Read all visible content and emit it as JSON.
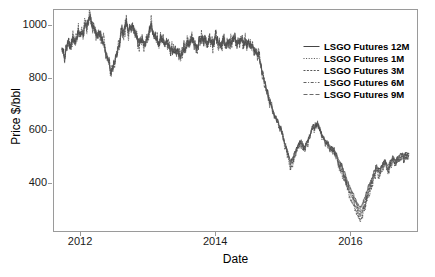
{
  "chart_data": {
    "type": "line",
    "title": "",
    "xlabel": "Date",
    "ylabel": "Price $/bbl",
    "xticks": [
      "2012",
      "2014",
      "2016"
    ],
    "xtick_values": [
      2012,
      2014,
      2016
    ],
    "yticks": [
      "1000",
      "800",
      "600",
      "400"
    ],
    "ytick_values": [
      1000,
      800,
      600,
      400
    ],
    "xlim": [
      2011.6,
      2017.0
    ],
    "ylim": [
      215,
      1060
    ],
    "grid": false,
    "legend_position": "upper right",
    "series": [
      {
        "name": "LSGO Futures 12M",
        "style": "solid",
        "color": "#303030",
        "dash": "none"
      },
      {
        "name": "LSGO Futures 1M",
        "style": "dotted",
        "color": "#3a3a3a",
        "dash": "1,1.6"
      },
      {
        "name": "LSGO Futures 3M",
        "style": "dashed-fine",
        "color": "#454545",
        "dash": "2,1.4"
      },
      {
        "name": "LSGO Futures 6M",
        "style": "dash-dot",
        "color": "#4f4f4f",
        "dash": "3,1.6,1,1.6"
      },
      {
        "name": "LSGO Futures 9M",
        "style": "long-dash",
        "color": "#5a5a5a",
        "dash": "4,2"
      }
    ],
    "x": [
      2011.72,
      2011.76,
      2011.8,
      2011.84,
      2011.88,
      2011.92,
      2011.96,
      2012.0,
      2012.04,
      2012.08,
      2012.12,
      2012.16,
      2012.2,
      2012.24,
      2012.28,
      2012.32,
      2012.36,
      2012.4,
      2012.44,
      2012.48,
      2012.52,
      2012.56,
      2012.6,
      2012.64,
      2012.68,
      2012.72,
      2012.76,
      2012.8,
      2012.84,
      2012.88,
      2012.92,
      2012.96,
      2013.0,
      2013.04,
      2013.08,
      2013.12,
      2013.16,
      2013.2,
      2013.24,
      2013.28,
      2013.32,
      2013.36,
      2013.4,
      2013.44,
      2013.48,
      2013.52,
      2013.56,
      2013.6,
      2013.64,
      2013.68,
      2013.72,
      2013.76,
      2013.8,
      2013.84,
      2013.88,
      2013.92,
      2013.96,
      2014.0,
      2014.04,
      2014.08,
      2014.12,
      2014.16,
      2014.2,
      2014.24,
      2014.28,
      2014.32,
      2014.36,
      2014.4,
      2014.44,
      2014.48,
      2014.52,
      2014.56,
      2014.6,
      2014.64,
      2014.68,
      2014.72,
      2014.76,
      2014.8,
      2014.84,
      2014.88,
      2014.92,
      2014.96,
      2015.0,
      2015.04,
      2015.08,
      2015.12,
      2015.16,
      2015.2,
      2015.24,
      2015.28,
      2015.32,
      2015.36,
      2015.4,
      2015.44,
      2015.48,
      2015.52,
      2015.56,
      2015.6,
      2015.64,
      2015.68,
      2015.72,
      2015.76,
      2015.8,
      2015.84,
      2015.88,
      2015.92,
      2015.96,
      2016.0,
      2016.04,
      2016.08,
      2016.12,
      2016.16,
      2016.2,
      2016.24,
      2016.28,
      2016.32,
      2016.36,
      2016.4,
      2016.44,
      2016.48,
      2016.52,
      2016.56,
      2016.6,
      2016.64,
      2016.68,
      2016.72,
      2016.76,
      2016.8,
      2016.84,
      2016.88,
      2016.92
    ],
    "values_12m": [
      905,
      880,
      935,
      915,
      950,
      930,
      975,
      955,
      985,
      1005,
      1030,
      1010,
      985,
      960,
      975,
      940,
      905,
      870,
      825,
      845,
      880,
      920,
      960,
      990,
      1010,
      985,
      1000,
      975,
      955,
      935,
      950,
      930,
      965,
      1000,
      975,
      950,
      930,
      945,
      925,
      940,
      920,
      905,
      890,
      905,
      885,
      900,
      915,
      930,
      950,
      935,
      920,
      935,
      950,
      940,
      925,
      945,
      930,
      955,
      940,
      930,
      945,
      930,
      945,
      935,
      950,
      940,
      930,
      945,
      935,
      920,
      930,
      915,
      900,
      880,
      845,
      800,
      760,
      720,
      690,
      660,
      640,
      615,
      585,
      540,
      500,
      475,
      490,
      520,
      545,
      560,
      530,
      545,
      575,
      600,
      615,
      625,
      600,
      575,
      560,
      545,
      530,
      520,
      505,
      480,
      460,
      430,
      400,
      370,
      345,
      320,
      300,
      290,
      310,
      340,
      375,
      400,
      430,
      455,
      440,
      460,
      480,
      455,
      470,
      490,
      475,
      490,
      505,
      495,
      510,
      505
    ],
    "annotations": []
  },
  "figure": {
    "width": 435,
    "height": 277,
    "background": "#ffffff",
    "frame_color": "#9a9a9a"
  }
}
